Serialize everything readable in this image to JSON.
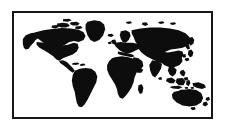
{
  "image": {
    "kind": "world-map-silhouette",
    "width": 225,
    "height": 127,
    "background_color": "#ffffff",
    "alt_text": "Black silhouette world map inside a thin black rectangular border"
  },
  "frame": {
    "name": "map-border",
    "border_color": "#171717",
    "border_width_px": 2,
    "fill_color": "#ffffff",
    "left_px": 12,
    "top_px": 11,
    "width_px": 201,
    "height_px": 108
  },
  "map": {
    "title": "",
    "projection": "Miller cylindrical",
    "land_color": "#0d0d0d",
    "ocean_color": "#ffffff",
    "has_labels": false,
    "has_graticule": false,
    "has_antarctica": false,
    "regions": [
      {
        "id": "north-america",
        "label": "North America"
      },
      {
        "id": "alaska",
        "label": "Alaska"
      },
      {
        "id": "greenland",
        "label": "Greenland"
      },
      {
        "id": "canadian-arctic",
        "label": "Canadian Arctic Archipelago"
      },
      {
        "id": "central-america",
        "label": "Central America"
      },
      {
        "id": "caribbean",
        "label": "Caribbean Islands"
      },
      {
        "id": "south-america",
        "label": "South America"
      },
      {
        "id": "europe",
        "label": "Europe"
      },
      {
        "id": "british-isles",
        "label": "British Isles"
      },
      {
        "id": "scandinavia",
        "label": "Scandinavia"
      },
      {
        "id": "iceland",
        "label": "Iceland"
      },
      {
        "id": "africa",
        "label": "Africa"
      },
      {
        "id": "madagascar",
        "label": "Madagascar"
      },
      {
        "id": "arabia",
        "label": "Arabian Peninsula"
      },
      {
        "id": "asia",
        "label": "Asia"
      },
      {
        "id": "india",
        "label": "Indian Subcontinent"
      },
      {
        "id": "japan",
        "label": "Japan"
      },
      {
        "id": "southeast-asia",
        "label": "Southeast Asia"
      },
      {
        "id": "indonesia",
        "label": "Indonesian Archipelago"
      },
      {
        "id": "philippines",
        "label": "Philippines"
      },
      {
        "id": "new-guinea",
        "label": "New Guinea"
      },
      {
        "id": "australia",
        "label": "Australia"
      },
      {
        "id": "new-zealand",
        "label": "New Zealand"
      }
    ]
  }
}
